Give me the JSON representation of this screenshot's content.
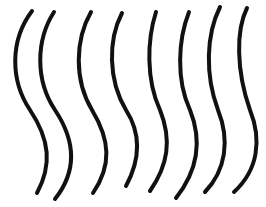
{
  "figure": {
    "stroke_color": "#111111",
    "background_color": "#ffffff",
    "line_count": 8,
    "lines": [
      {
        "id": 1,
        "d": "M32,11 C10,40 10,80 30,110 C50,140 52,165 37,193"
      },
      {
        "id": 2,
        "d": "M54,12 C36,40 35,80 55,110 C75,140 78,170 55,199"
      },
      {
        "id": 3,
        "d": "M91,12 C75,40 74,80 92,110 C110,140 112,165 93,193"
      },
      {
        "id": 4,
        "d": "M122,13 C108,40 108,80 126,110 C142,135 140,160 126,186"
      },
      {
        "id": 5,
        "d": "M156,12 C147,40 146,80 160,110 C172,140 168,165 150,191"
      },
      {
        "id": 6,
        "d": "M189,12 C178,40 176,80 190,110 C202,140 198,170 176,198"
      },
      {
        "id": 7,
        "d": "M220,7 C206,35 205,75 218,110 C230,140 226,170 205,192"
      },
      {
        "id": 8,
        "d": "M247,8 C236,30 236,70 250,110 C262,140 258,170 234,192"
      }
    ]
  }
}
